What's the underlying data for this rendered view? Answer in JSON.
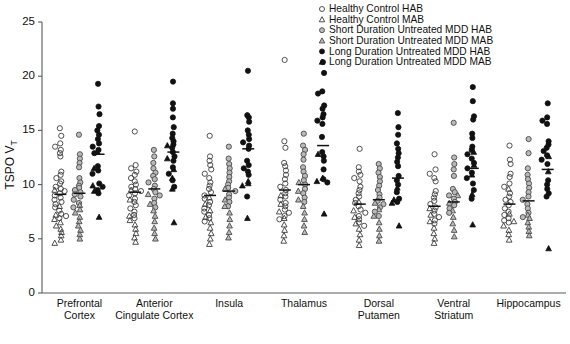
{
  "figure": {
    "title": "",
    "caption": ""
  },
  "axes": {
    "ylabel_main": "TSPO V",
    "ylabel_sub": "T",
    "yticks": [
      0,
      5,
      10,
      15,
      20,
      25
    ],
    "ylim": [
      0,
      25
    ],
    "grid": false
  },
  "legend": {
    "position": "top-right",
    "entries": [
      {
        "label": "Healthy Control HAB",
        "marker": "open-circle",
        "color": "#ffffff"
      },
      {
        "label": "Healthy Control MAB",
        "marker": "open-triangle",
        "color": "#ffffff"
      },
      {
        "label": "Short Duration Untreated MDD HAB",
        "marker": "gray-circle",
        "color": "#b9b9b9"
      },
      {
        "label": "Short Duration Untreated MDD MAB",
        "marker": "gray-triangle",
        "color": "#b9b9b9"
      },
      {
        "label": "Long Duration Untreated MDD HAB",
        "marker": "filled-circle",
        "color": "#111111"
      },
      {
        "label": "Long Duration Untreated MDD MAB",
        "marker": "filled-triangle",
        "color": "#111111"
      }
    ]
  },
  "chart_data": {
    "type": "scatter",
    "title": "",
    "xlabel": "",
    "ylabel": "TSPO VT",
    "ylim": [
      0,
      25
    ],
    "yticks": [
      0,
      5,
      10,
      15,
      20,
      25
    ],
    "grid": false,
    "legend_position": "top-right",
    "categories": [
      "Prefrontal Cortex",
      "Anterior Cingulate Cortex",
      "Insula",
      "Thalamus",
      "Dorsal Putamen",
      "Ventral Striatum",
      "Hippocampus"
    ],
    "series": [
      {
        "name": "Healthy Control HAB",
        "marker": "open-circle"
      },
      {
        "name": "Healthy Control MAB",
        "marker": "open-triangle"
      },
      {
        "name": "Short Duration Untreated MDD HAB",
        "marker": "gray-circle"
      },
      {
        "name": "Short Duration Untreated MDD MAB",
        "marker": "gray-triangle"
      },
      {
        "name": "Long Duration Untreated MDD HAB",
        "marker": "filled-circle"
      },
      {
        "name": "Long Duration Untreated MDD MAB",
        "marker": "filled-triangle"
      }
    ],
    "groups": [
      {
        "category": "Prefrontal Cortex",
        "columns": [
          {
            "series": "Healthy Control",
            "mean": 9.1,
            "hab_values": [
              15.2,
              14.5,
              13.8,
              13.5,
              13.2,
              12.9,
              12.6,
              11.2,
              10.9,
              10.6,
              10.3,
              10.1,
              9.8,
              9.6,
              9.4,
              9.2,
              9.0,
              8.8,
              8.6,
              8.4,
              8.2,
              7.9,
              7.6,
              7.3,
              7.1,
              6.9
            ],
            "mab_values": [
              9.5,
              8.0,
              7.2,
              6.8,
              6.5,
              6.2,
              5.9,
              5.6,
              5.3,
              4.9,
              4.6
            ]
          },
          {
            "series": "Short Duration Untreated MDD",
            "mean": 9.2,
            "hab_values": [
              14.6,
              12.8,
              12.4,
              12.0,
              11.6,
              10.6,
              10.2,
              9.9,
              9.7,
              9.5,
              9.3,
              9.1,
              8.9,
              8.6,
              8.3,
              7.9
            ],
            "mab_values": [
              8.1,
              7.7,
              7.4,
              7.0,
              6.6,
              6.2,
              5.8,
              5.4,
              5.0
            ]
          },
          {
            "series": "Long Duration Untreated MDD",
            "mean": 12.8,
            "hab_values": [
              19.3,
              17.2,
              16.5,
              15.4,
              15.0,
              14.6,
              14.2,
              13.8,
              13.5,
              13.2,
              12.9,
              11.7,
              11.3,
              11.0,
              10.1,
              9.8,
              9.5,
              9.2
            ],
            "mab_values": [
              13.0,
              11.5,
              9.9,
              9.4,
              7.0
            ]
          }
        ]
      },
      {
        "category": "Anterior Cingulate Cortex",
        "columns": [
          {
            "series": "Healthy Control",
            "mean": 9.3,
            "hab_values": [
              14.9,
              11.8,
              11.5,
              11.2,
              10.9,
              10.6,
              10.3,
              10.0,
              9.8,
              9.6,
              9.4,
              9.2,
              9.0,
              8.7,
              8.4,
              8.1,
              7.8,
              7.5,
              7.2,
              6.9
            ],
            "mab_values": [
              9.5,
              8.6,
              7.1,
              6.7,
              6.3,
              5.9,
              5.5,
              5.1,
              4.7
            ]
          },
          {
            "series": "Short Duration Untreated MDD",
            "mean": 9.6,
            "hab_values": [
              13.2,
              12.6,
              12.0,
              11.5,
              11.1,
              10.8,
              10.5,
              10.2,
              9.9,
              9.6,
              9.3,
              9.0,
              8.7,
              8.3,
              7.9
            ],
            "mab_values": [
              9.1,
              8.2,
              7.6,
              7.1,
              6.6,
              6.0,
              5.5,
              5.0
            ]
          },
          {
            "series": "Long Duration Untreated MDD",
            "mean": 13.0,
            "hab_values": [
              19.5,
              17.5,
              17.0,
              16.2,
              15.3,
              14.7,
              14.3,
              14.0,
              13.7,
              13.4,
              13.0,
              12.6,
              12.2,
              11.6,
              11.0,
              10.4,
              9.8
            ],
            "mab_values": [
              13.6,
              12.4,
              11.4,
              10.6,
              9.6,
              6.5
            ]
          }
        ]
      },
      {
        "category": "Insula",
        "columns": [
          {
            "series": "Healthy Control",
            "mean": 9.0,
            "hab_values": [
              14.5,
              12.6,
              12.2,
              11.8,
              11.4,
              11.0,
              10.6,
              10.2,
              9.9,
              9.6,
              9.3,
              9.0,
              8.7,
              8.4,
              8.1,
              7.8,
              7.5,
              7.2,
              6.9,
              6.6
            ],
            "mab_values": [
              8.8,
              8.2,
              7.6,
              7.0,
              6.5,
              6.0,
              5.5,
              5.0,
              4.5
            ]
          },
          {
            "series": "Short Duration Untreated MDD",
            "mean": 9.4,
            "hab_values": [
              13.5,
              12.4,
              11.9,
              11.5,
              11.1,
              10.7,
              10.3,
              10.0,
              9.7,
              9.4,
              9.1,
              8.8,
              8.4,
              8.0
            ],
            "mab_values": [
              9.6,
              8.6,
              8.0,
              7.4,
              6.8,
              6.2,
              5.6,
              5.1
            ]
          },
          {
            "series": "Long Duration Untreated MDD",
            "mean": 13.3,
            "hab_values": [
              20.5,
              16.4,
              16.2,
              15.8,
              15.0,
              14.6,
              14.2,
              13.9,
              13.6,
              13.3,
              12.2,
              11.8,
              11.5,
              11.2,
              10.9,
              8.9
            ],
            "mab_values": [
              10.3,
              10.1,
              9.9,
              6.9
            ]
          }
        ]
      },
      {
        "category": "Thalamus",
        "columns": [
          {
            "series": "Healthy Control",
            "mean": 9.5,
            "hab_values": [
              21.5,
              14.0,
              13.4,
              12.0,
              11.7,
              11.3,
              10.9,
              10.5,
              10.1,
              9.8,
              9.5,
              9.2,
              8.9,
              8.6,
              8.3,
              8.0,
              7.7,
              7.4,
              7.1,
              6.8
            ],
            "mab_values": [
              9.0,
              8.2,
              7.5,
              6.9,
              6.3,
              5.8,
              5.3,
              4.8
            ]
          },
          {
            "series": "Short Duration Untreated MDD",
            "mean": 10.0,
            "hab_values": [
              14.7,
              13.6,
              13.2,
              12.8,
              12.3,
              11.6,
              11.2,
              10.8,
              10.4,
              10.0,
              9.6,
              9.2,
              8.8,
              8.4
            ],
            "mab_values": [
              10.2,
              9.4,
              8.6,
              8.0,
              7.4,
              6.8,
              6.2,
              5.6
            ]
          },
          {
            "series": "Long Duration Untreated MDD",
            "mean": 13.6,
            "hab_values": [
              21.3,
              20.3,
              18.6,
              18.4,
              17.3,
              17.0,
              16.5,
              16.2,
              15.9,
              15.6,
              14.4,
              13.0,
              12.6,
              12.2,
              11.4,
              10.5,
              10.2
            ],
            "mab_values": [
              12.8,
              10.6,
              10.3,
              7.3
            ]
          }
        ]
      },
      {
        "category": "Dorsal Putamen",
        "columns": [
          {
            "series": "Healthy Control",
            "mean": 8.2,
            "hab_values": [
              13.3,
              11.6,
              11.2,
              10.9,
              10.6,
              10.3,
              9.8,
              9.5,
              9.2,
              8.9,
              8.6,
              8.3,
              8.0,
              7.7,
              7.4,
              7.1,
              6.8,
              6.5,
              6.2
            ],
            "mab_values": [
              8.4,
              7.6,
              7.0,
              6.4,
              5.9,
              5.4,
              4.9,
              4.4
            ]
          },
          {
            "series": "Short Duration Untreated MDD",
            "mean": 8.6,
            "hab_values": [
              11.9,
              11.5,
              11.1,
              10.7,
              10.3,
              9.9,
              9.5,
              9.1,
              8.8,
              8.5,
              8.2,
              7.9,
              7.5,
              7.1
            ],
            "mab_values": [
              8.3,
              7.7,
              7.1,
              6.5,
              5.9,
              5.3,
              4.8
            ]
          },
          {
            "series": "Long Duration Untreated MDD",
            "mean": 10.6,
            "hab_values": [
              16.6,
              15.3,
              14.6,
              13.8,
              13.3,
              12.9,
              12.5,
              12.1,
              11.7,
              10.8,
              10.4,
              10.0,
              9.3,
              8.7,
              8.4
            ],
            "mab_values": [
              9.7,
              8.6,
              8.3,
              6.2
            ]
          }
        ]
      },
      {
        "category": "Ventral Striatum",
        "columns": [
          {
            "series": "Healthy Control",
            "mean": 8.0,
            "hab_values": [
              12.8,
              11.4,
              11.0,
              10.6,
              10.3,
              9.4,
              9.1,
              8.8,
              8.5,
              8.2,
              7.9,
              7.6,
              7.3,
              7.0,
              6.7,
              6.4
            ],
            "mab_values": [
              7.8,
              7.2,
              6.6,
              6.0,
              5.5,
              5.0,
              4.6
            ]
          },
          {
            "series": "Short Duration Untreated MDD",
            "mean": 8.4,
            "hab_values": [
              15.7,
              12.5,
              11.9,
              11.4,
              10.8,
              9.6,
              9.3,
              9.0,
              8.7,
              8.4,
              8.1,
              7.8,
              7.4
            ],
            "mab_values": [
              9.0,
              8.3,
              7.6,
              7.0,
              6.4,
              5.8,
              5.2
            ]
          },
          {
            "series": "Long Duration Untreated MDD",
            "mean": 11.5,
            "hab_values": [
              19.0,
              17.7,
              16.3,
              16.0,
              14.7,
              14.3,
              13.5,
              13.2,
              12.8,
              12.4,
              12.0,
              11.5,
              11.1,
              10.6,
              10.1,
              9.5,
              8.7
            ],
            "mab_values": [
              13.0,
              11.8,
              10.9,
              9.1,
              6.3
            ]
          }
        ]
      },
      {
        "category": "Hippocampus",
        "columns": [
          {
            "series": "Healthy Control",
            "mean": 8.2,
            "hab_values": [
              13.6,
              12.3,
              11.9,
              11.0,
              10.7,
              10.1,
              9.8,
              9.2,
              8.9,
              8.6,
              8.4,
              8.1,
              7.8,
              7.5,
              7.2,
              6.9,
              6.7,
              6.5
            ],
            "mab_values": [
              9.6,
              7.3,
              6.6,
              6.2,
              5.8,
              5.4,
              4.9
            ]
          },
          {
            "series": "Short Duration Untreated MDD",
            "mean": 8.5,
            "hab_values": [
              14.2,
              12.9,
              11.5,
              10.9,
              10.5,
              10.1,
              9.7,
              9.3,
              8.9,
              8.6,
              8.2,
              7.8,
              7.4,
              7.0
            ],
            "mab_values": [
              7.2,
              6.9,
              6.5,
              6.1,
              5.7,
              5.3
            ]
          },
          {
            "series": "Long Duration Untreated MDD",
            "mean": 11.4,
            "hab_values": [
              17.5,
              16.2,
              15.9,
              15.6,
              14.0,
              13.7,
              13.4,
              13.1,
              12.7,
              12.3,
              11.9,
              10.4,
              10.0,
              9.6,
              9.2,
              8.9
            ],
            "mab_values": [
              12.6,
              11.2,
              4.1
            ]
          }
        ]
      }
    ]
  }
}
